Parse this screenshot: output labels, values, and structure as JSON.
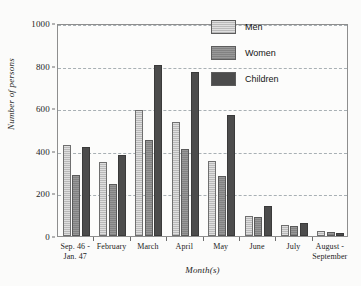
{
  "chart_data": {
    "type": "bar",
    "title": "",
    "xlabel": "Month(s)",
    "ylabel": "Number of persons",
    "ylim": [
      0,
      1000
    ],
    "yticks": [
      0,
      200,
      400,
      600,
      800,
      1000
    ],
    "grid": true,
    "legend_position": "top-right",
    "categories": [
      "Sep. 46 -\nJan. 47",
      "February",
      "March",
      "April",
      "May",
      "June",
      "July",
      "August -\nSeptember"
    ],
    "series": [
      {
        "name": "Men",
        "color": "#b9b9b9",
        "values": [
          425,
          348,
          592,
          537,
          353,
          92,
          50,
          23
        ]
      },
      {
        "name": "Women",
        "color": "#828282",
        "values": [
          285,
          242,
          450,
          408,
          282,
          90,
          48,
          19
        ]
      },
      {
        "name": "Children",
        "color": "#4c4c4c",
        "values": [
          420,
          382,
          805,
          772,
          568,
          140,
          63,
          12
        ]
      }
    ]
  },
  "legend": {
    "items": [
      {
        "label": "Men",
        "key": "men"
      },
      {
        "label": "Women",
        "key": "women"
      },
      {
        "label": "Children",
        "key": "children"
      }
    ]
  }
}
